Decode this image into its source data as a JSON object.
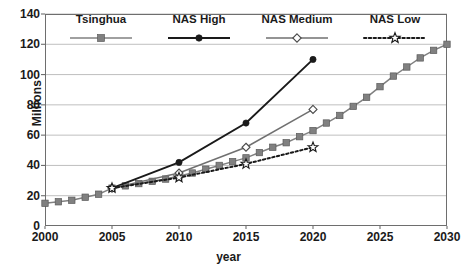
{
  "chart_data": {
    "type": "line",
    "title": "",
    "xlabel": "year",
    "ylabel": "Millions",
    "xlim": [
      2000,
      2030
    ],
    "ylim": [
      0,
      140
    ],
    "xticks": [
      2000,
      2005,
      2010,
      2015,
      2020,
      2025,
      2030
    ],
    "yticks": [
      0,
      20,
      40,
      60,
      80,
      100,
      120,
      140
    ],
    "grid": "horizontal",
    "legend_position": "top-inside",
    "series": [
      {
        "name": "Tsinghua",
        "marker": "filled-square",
        "color": "#808080",
        "line_style": "solid",
        "x": [
          2000,
          2001,
          2002,
          2003,
          2004,
          2005,
          2006,
          2007,
          2008,
          2009,
          2010,
          2011,
          2012,
          2013,
          2014,
          2015,
          2016,
          2017,
          2018,
          2019,
          2020,
          2021,
          2022,
          2023,
          2024,
          2025,
          2026,
          2027,
          2028,
          2029,
          2030
        ],
        "y": [
          15,
          16,
          17,
          19,
          21,
          25,
          26.5,
          28,
          29.5,
          31,
          33,
          35,
          37.5,
          40,
          42.5,
          45,
          48.5,
          52,
          55,
          59,
          63,
          68,
          73,
          79,
          85,
          92,
          99,
          105,
          111,
          116,
          120
        ]
      },
      {
        "name": "NAS High",
        "marker": "filled-circle",
        "color": "#1a1a1a",
        "line_style": "solid",
        "x": [
          2005,
          2010,
          2015,
          2020
        ],
        "y": [
          25,
          42,
          68,
          110
        ]
      },
      {
        "name": "NAS Medium",
        "marker": "open-diamond",
        "color": "#707070",
        "line_style": "solid",
        "x": [
          2005,
          2010,
          2015,
          2020
        ],
        "y": [
          25,
          35,
          52,
          77
        ]
      },
      {
        "name": "NAS Low",
        "marker": "open-star",
        "color": "#1a1a1a",
        "line_style": "dotted",
        "x": [
          2005,
          2010,
          2015,
          2020
        ],
        "y": [
          25,
          32,
          41,
          52
        ]
      }
    ]
  }
}
